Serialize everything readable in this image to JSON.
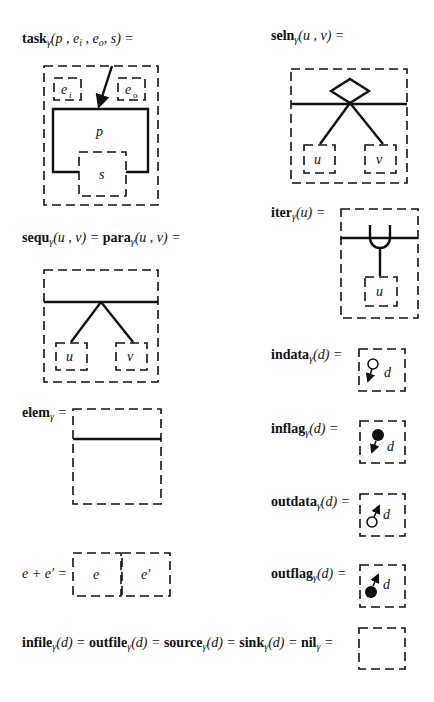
{
  "labels": {
    "task": {
      "name": "task",
      "sub": "γ",
      "args": "(p , e",
      "arg_i": "i",
      "mid": " , e",
      "arg_o": "o",
      "tail": ", s) ="
    },
    "seln": {
      "name": "seln",
      "sub": "γ",
      "args": "(u , v) ="
    },
    "sequ": {
      "name": "sequ",
      "sub": "γ",
      "args": "(u , v) = ",
      "name2": "para",
      "sub2": "γ",
      "args2": "(u , v) ="
    },
    "iter": {
      "name": "iter",
      "sub": "γ",
      "args": "(u) ="
    },
    "indata": {
      "name": "indata",
      "sub": "γ",
      "args": "(d) ="
    },
    "elem": {
      "name": "elem",
      "sub": "γ",
      "args": " ="
    },
    "inflag": {
      "name": "inflag",
      "sub": "γ",
      "args": "(d) ="
    },
    "outdata": {
      "name": "outdata",
      "sub": "γ",
      "args": "(d) ="
    },
    "sum": {
      "text": "e + e′ ="
    },
    "outflag": {
      "name": "outflag",
      "sub": "γ",
      "args": "(d) ="
    },
    "nil": {
      "parts": [
        {
          "name": "infile",
          "sub": "γ",
          "args": "(d) = "
        },
        {
          "name": "outfile",
          "sub": "γ",
          "args": "(d) = "
        },
        {
          "name": "source",
          "sub": "γ",
          "args": "(d) = "
        },
        {
          "name": "sink",
          "sub": "γ",
          "args": "(d) = "
        },
        {
          "name": "nil",
          "sub": "γ",
          "args": " ="
        }
      ]
    }
  },
  "diagram_text": {
    "task_ei": "e",
    "task_ei_sub": "i",
    "task_eo": "e",
    "task_eo_sub": "o",
    "task_p": "p",
    "task_s": "s",
    "seln_u": "u",
    "seln_v": "v",
    "sequ_u": "u",
    "sequ_v": "v",
    "iter_u": "u",
    "indata_d": "d",
    "inflag_d": "d",
    "outdata_d": "d",
    "outflag_d": "d",
    "sum_e": "e",
    "sum_e2": "e′"
  }
}
